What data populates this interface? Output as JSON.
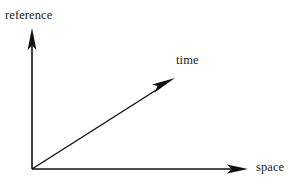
{
  "figure": {
    "type": "vector-axes-diagram",
    "background_color": "#ffffff",
    "stroke_color": "#111111",
    "text_color": "#1a1a1a",
    "width": 302,
    "height": 191,
    "origin": {
      "x": 32,
      "y": 169
    }
  },
  "axes": [
    {
      "id": "reference",
      "label": "reference",
      "direction": "up",
      "from": {
        "x": 32,
        "y": 169
      },
      "to": {
        "x": 32,
        "y": 28
      },
      "label_position": {
        "x": 5,
        "y": 9
      },
      "arrowhead": "solid-triangle"
    },
    {
      "id": "time",
      "label": "time",
      "direction": "up-right",
      "from": {
        "x": 32,
        "y": 169
      },
      "to": {
        "x": 175,
        "y": 78
      },
      "angle_degrees": 32,
      "label_position": {
        "x": 176,
        "y": 54
      },
      "arrowhead": "solid-triangle"
    },
    {
      "id": "space",
      "label": "space",
      "direction": "right",
      "from": {
        "x": 32,
        "y": 169
      },
      "to": {
        "x": 248,
        "y": 169
      },
      "label_position": {
        "x": 256,
        "y": 161
      },
      "arrowhead": "solid-triangle"
    }
  ],
  "labels": {
    "reference": "reference",
    "time": "time",
    "space": "space"
  }
}
